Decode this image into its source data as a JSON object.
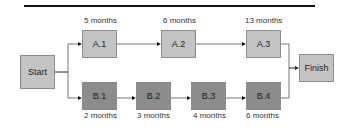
{
  "nodes": {
    "start": "Start",
    "a1": "A.1",
    "a2": "A.2",
    "a3": "A.3",
    "b1": "B.1",
    "b2": "B.2",
    "b3": "B.3",
    "b4": "B.4",
    "finish": "Finish"
  },
  "durations": {
    "a1": "5 months",
    "a2": "6 months",
    "a3": "13  months",
    "b1": "2 months",
    "b2": "3 months",
    "b3": "4  months",
    "b4": "6  months"
  }
}
